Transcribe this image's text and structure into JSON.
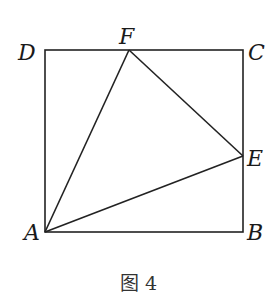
{
  "figure": {
    "caption": "图 4",
    "shape": "square ABCD with triangle AEF",
    "points": {
      "A": {
        "label": "A",
        "x": 45,
        "y": 232
      },
      "B": {
        "label": "B",
        "x": 243,
        "y": 232
      },
      "C": {
        "label": "C",
        "x": 243,
        "y": 50
      },
      "D": {
        "label": "D",
        "x": 45,
        "y": 50
      },
      "E": {
        "label": "E",
        "x": 243,
        "y": 156
      },
      "F": {
        "label": "F",
        "x": 129,
        "y": 50
      }
    },
    "segments": [
      "AB",
      "BC",
      "CD",
      "DA",
      "AF",
      "FE",
      "EA"
    ],
    "stroke_color": "#222222"
  }
}
